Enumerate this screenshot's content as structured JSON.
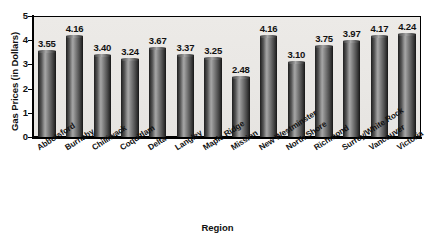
{
  "chart_data": {
    "type": "bar",
    "title": "",
    "xlabel": "Region",
    "ylabel": "Gas Prices (in Dollars)",
    "ylim": [
      0,
      5
    ],
    "ytick_labels": [
      "5",
      "4",
      "3",
      "2",
      "1",
      "0"
    ],
    "ytick_values": [
      5,
      4,
      3,
      2,
      1,
      0
    ],
    "grid": false,
    "legend": null,
    "categories": [
      "Abbotsford",
      "Burnaby",
      "Chilliwack",
      "Coquitlam",
      "Delta",
      "Langley",
      "Maple Ridge",
      "Mission",
      "New Westminster",
      "North Shore",
      "Richmond",
      "Surrey/White Rock",
      "Vancouver",
      "Victoria"
    ],
    "values": [
      3.55,
      4.16,
      3.4,
      3.24,
      3.67,
      3.37,
      3.25,
      2.48,
      4.16,
      3.1,
      3.75,
      3.97,
      4.17,
      4.24
    ],
    "value_labels": [
      "3.55",
      "4.16",
      "3.40",
      "3.24",
      "3.67",
      "3.37",
      "3.25",
      "2.48",
      "4.16",
      "3.10",
      "3.75",
      "3.97",
      "4.17",
      "4.24"
    ]
  },
  "colors": {
    "plot_background": "#eceae7",
    "page_background": "#ffffff",
    "axis": "#000000",
    "bar_dark": "#1f1f1f",
    "bar_light": "#a6a6a6",
    "text": "#111111"
  }
}
